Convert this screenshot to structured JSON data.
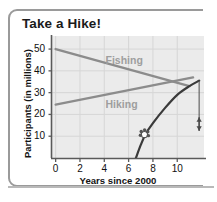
{
  "figure": {
    "title": "Take a Hike!",
    "frame_color": "#9a9a9a",
    "plot_background": "#ebebeb",
    "grid_color": "#d6d6d6",
    "axis_color": "#5a5a5a"
  },
  "chart_data": {
    "type": "line",
    "title": "Take a Hike!",
    "xlabel": "Years since 2000",
    "ylabel": "Participants (in millions)",
    "xlim": [
      -0.3,
      12.2
    ],
    "ylim": [
      0,
      56
    ],
    "xticks": [
      0,
      2,
      4,
      6,
      8,
      10
    ],
    "yticks": [
      10,
      20,
      30,
      40,
      50
    ],
    "xtick_labels": [
      "0",
      "2",
      "4",
      "6",
      "8",
      "10"
    ],
    "ytick_labels": [
      "10",
      "20",
      "30",
      "40",
      "50"
    ],
    "grid": true,
    "legend": "inline-labels",
    "series": [
      {
        "name": "Fishing",
        "type": "line",
        "color": "#8c8c8c",
        "label_position": [
          4.1,
          45
        ],
        "points": [
          [
            0,
            50
          ],
          [
            11.0,
            33
          ]
        ]
      },
      {
        "name": "Hiking",
        "type": "line",
        "color": "#8c8c8c",
        "label_position": [
          4.1,
          25
        ],
        "points": [
          [
            0,
            24.5
          ],
          [
            11.3,
            37
          ]
        ]
      },
      {
        "name": "Hiking curve",
        "type": "curve",
        "color": "#3a3a3a",
        "points": [
          [
            6.6,
            0
          ],
          [
            7.0,
            6
          ],
          [
            7.4,
            11
          ],
          [
            8.0,
            16
          ],
          [
            9.0,
            23
          ],
          [
            10.0,
            29
          ],
          [
            11.0,
            33
          ],
          [
            11.8,
            35.5
          ]
        ]
      }
    ],
    "annotations": [
      {
        "name": "paw-print-marker",
        "type": "marker",
        "symbol": "paw-print",
        "x": 7.3,
        "y": 11,
        "color": "#555555"
      },
      {
        "name": "gap-measure-arrow",
        "type": "double-arrow",
        "x": 11.8,
        "y_top": 35.5,
        "y_bottom": 12.5,
        "color": "#4a4a4a"
      }
    ]
  },
  "axis_labels": {
    "y_title": "Participants (in millions)",
    "x_title": "Years since 2000"
  }
}
